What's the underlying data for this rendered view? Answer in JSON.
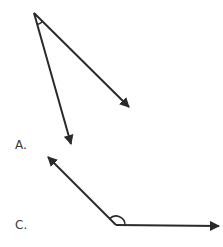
{
  "stroke_color": "#2a2a2a",
  "label_color": "#3a3a3a",
  "diagrams": [
    {
      "label": "A.",
      "label_pos": {
        "x": 15,
        "y": 139
      },
      "vertex": {
        "x": 34,
        "y": 13
      },
      "rays": [
        {
          "tip": {
            "x": 129,
            "y": 107
          }
        },
        {
          "tip": {
            "x": 71,
            "y": 144
          }
        }
      ],
      "arc": {
        "radius": 12,
        "type": "acute"
      }
    },
    {
      "label": "C.",
      "label_pos": {
        "x": 15,
        "y": 219
      },
      "vertex": {
        "x": 116,
        "y": 225
      },
      "rays": [
        {
          "tip": {
            "x": 48,
            "y": 157
          }
        },
        {
          "tip": {
            "x": 219,
            "y": 226
          }
        }
      ],
      "arc": {
        "radius": 9,
        "type": "obtuse"
      }
    }
  ]
}
